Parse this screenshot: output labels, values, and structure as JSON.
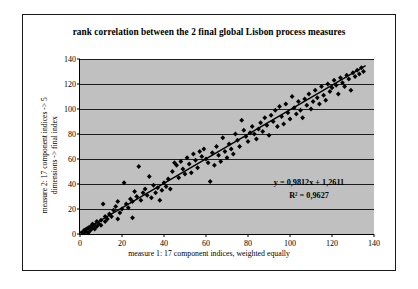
{
  "chart_data": {
    "type": "scatter",
    "title": "rank correlation between the 2 final global Lisbon process measures",
    "xlabel": "measure 1: 17 component indices, weighted equally",
    "ylabel_line1": "measure 2: 17 component indices -> 5",
    "ylabel_line2": "dimensions -> final index",
    "xlim": [
      0,
      140
    ],
    "ylim": [
      0,
      140
    ],
    "xticks": [
      0,
      20,
      40,
      60,
      80,
      100,
      120,
      140
    ],
    "yticks": [
      0,
      20,
      40,
      60,
      80,
      100,
      120,
      140
    ],
    "grid": "horizontal",
    "legend": "none",
    "plot_background": "#c0c0c0",
    "marker": "diamond",
    "marker_color": "#000000",
    "trendline": {
      "type": "linear",
      "color": "#000000",
      "slope": 0.9812,
      "intercept": 1.2611,
      "r_squared": 0.9627,
      "equation_label": "y = 0,9812x + 1,2611",
      "r2_label": "R² = 0,9627"
    },
    "points": [
      [
        1,
        1
      ],
      [
        2,
        1
      ],
      [
        2,
        3
      ],
      [
        3,
        2
      ],
      [
        3,
        4
      ],
      [
        4,
        1
      ],
      [
        4,
        5
      ],
      [
        5,
        3
      ],
      [
        5,
        6
      ],
      [
        6,
        5
      ],
      [
        6,
        8
      ],
      [
        7,
        4
      ],
      [
        7,
        7
      ],
      [
        8,
        6
      ],
      [
        8,
        10
      ],
      [
        9,
        8
      ],
      [
        10,
        7
      ],
      [
        10,
        11
      ],
      [
        11,
        24
      ],
      [
        12,
        10
      ],
      [
        12,
        14
      ],
      [
        13,
        12
      ],
      [
        14,
        16
      ],
      [
        15,
        14
      ],
      [
        16,
        19
      ],
      [
        17,
        22
      ],
      [
        18,
        12
      ],
      [
        18,
        26
      ],
      [
        19,
        17
      ],
      [
        20,
        20
      ],
      [
        21,
        41
      ],
      [
        22,
        24
      ],
      [
        23,
        21
      ],
      [
        24,
        28
      ],
      [
        25,
        13
      ],
      [
        25,
        26
      ],
      [
        26,
        34
      ],
      [
        27,
        30
      ],
      [
        28,
        54
      ],
      [
        29,
        27
      ],
      [
        30,
        33
      ],
      [
        31,
        36
      ],
      [
        32,
        31
      ],
      [
        33,
        46
      ],
      [
        34,
        29
      ],
      [
        35,
        39
      ],
      [
        36,
        33
      ],
      [
        37,
        37
      ],
      [
        38,
        27
      ],
      [
        39,
        35
      ],
      [
        40,
        41
      ],
      [
        41,
        38
      ],
      [
        42,
        44
      ],
      [
        43,
        36
      ],
      [
        44,
        50
      ],
      [
        45,
        57
      ],
      [
        46,
        55
      ],
      [
        47,
        45
      ],
      [
        48,
        58
      ],
      [
        49,
        52
      ],
      [
        50,
        48
      ],
      [
        51,
        61
      ],
      [
        52,
        56
      ],
      [
        53,
        49
      ],
      [
        54,
        64
      ],
      [
        55,
        59
      ],
      [
        56,
        53
      ],
      [
        57,
        66
      ],
      [
        58,
        62
      ],
      [
        59,
        68
      ],
      [
        60,
        60
      ],
      [
        61,
        57
      ],
      [
        62,
        42
      ],
      [
        63,
        65
      ],
      [
        64,
        55
      ],
      [
        65,
        70
      ],
      [
        66,
        63
      ],
      [
        67,
        58
      ],
      [
        68,
        77
      ],
      [
        69,
        66
      ],
      [
        70,
        61
      ],
      [
        71,
        72
      ],
      [
        72,
        68
      ],
      [
        73,
        64
      ],
      [
        74,
        80
      ],
      [
        75,
        75
      ],
      [
        76,
        70
      ],
      [
        77,
        91
      ],
      [
        78,
        83
      ],
      [
        79,
        78
      ],
      [
        80,
        74
      ],
      [
        81,
        81
      ],
      [
        82,
        86
      ],
      [
        83,
        80
      ],
      [
        84,
        76
      ],
      [
        85,
        84
      ],
      [
        86,
        89
      ],
      [
        87,
        82
      ],
      [
        88,
        93
      ],
      [
        89,
        87
      ],
      [
        90,
        79
      ],
      [
        91,
        95
      ],
      [
        92,
        90
      ],
      [
        93,
        99
      ],
      [
        94,
        86
      ],
      [
        95,
        102
      ],
      [
        96,
        94
      ],
      [
        97,
        88
      ],
      [
        98,
        104
      ],
      [
        99,
        97
      ],
      [
        100,
        92
      ],
      [
        101,
        110
      ],
      [
        102,
        101
      ],
      [
        103,
        96
      ],
      [
        104,
        106
      ],
      [
        105,
        99
      ],
      [
        106,
        93
      ],
      [
        107,
        108
      ],
      [
        108,
        103
      ],
      [
        109,
        112
      ],
      [
        110,
        100
      ],
      [
        111,
        106
      ],
      [
        112,
        115
      ],
      [
        113,
        109
      ],
      [
        114,
        104
      ],
      [
        115,
        118
      ],
      [
        116,
        111
      ],
      [
        117,
        107
      ],
      [
        118,
        120
      ],
      [
        119,
        114
      ],
      [
        120,
        117
      ],
      [
        121,
        123
      ],
      [
        122,
        119
      ],
      [
        123,
        112
      ],
      [
        124,
        125
      ],
      [
        125,
        121
      ],
      [
        126,
        118
      ],
      [
        127,
        127
      ],
      [
        128,
        124
      ],
      [
        129,
        115
      ],
      [
        130,
        129
      ],
      [
        131,
        126
      ],
      [
        132,
        131
      ],
      [
        133,
        128
      ],
      [
        134,
        133
      ],
      [
        135,
        130
      ]
    ]
  }
}
